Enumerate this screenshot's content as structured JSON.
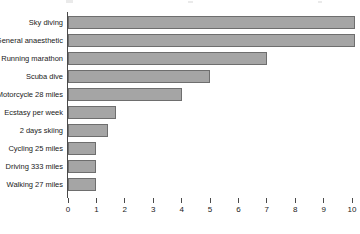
{
  "chart_data": {
    "type": "bar",
    "orientation": "horizontal",
    "title": "",
    "subtitle": "",
    "xlabel": "",
    "ylabel": "",
    "xlim": [
      0,
      10.14
    ],
    "ylim": null,
    "grid": false,
    "legend": null,
    "bar_color": "#a5a5a5",
    "bar_border_color": "#6e6e6e",
    "axis_color": "#4a4a4a",
    "categories": [
      "Sky diving",
      "General anaesthetic",
      "Running marathon",
      "Scuba dive",
      "Motorcycle 28 miles",
      "Ecstasy per week",
      "2 days skiing",
      "Cycling 25 miles",
      "Driving 333 miles",
      "Walking 27 miles"
    ],
    "values": [
      10.1,
      10.1,
      7.0,
      5.0,
      4.0,
      1.7,
      1.4,
      1.0,
      1.0,
      1.0
    ],
    "xticks": [
      0,
      1,
      2,
      3,
      4,
      5,
      6,
      7,
      8,
      9,
      10
    ],
    "xtick_labels": [
      "0",
      "1",
      "2",
      "3",
      "4",
      "5",
      "6",
      "7",
      "8",
      "9",
      "10"
    ]
  }
}
